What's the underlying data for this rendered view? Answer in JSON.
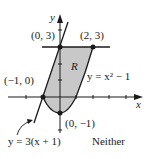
{
  "figure": {
    "axis_x_label": "x",
    "axis_y_label": "y",
    "region_label": "R",
    "points": [
      {
        "label": "(0, 3)",
        "x": 0,
        "y": 3
      },
      {
        "label": "(2, 3)",
        "x": 2,
        "y": 3
      },
      {
        "label": "(−1, 0)",
        "x": -1,
        "y": 0
      },
      {
        "label": "(0, −1)",
        "x": 0,
        "y": -1
      }
    ],
    "curves": {
      "parabola": "y = x² − 1",
      "line": "y = 3(x + 1)",
      "horizontal": "y = 3"
    },
    "classification": "Neither",
    "colors": {
      "region_fill": "#c8c8c8",
      "stroke": "#1a1a1a"
    }
  }
}
